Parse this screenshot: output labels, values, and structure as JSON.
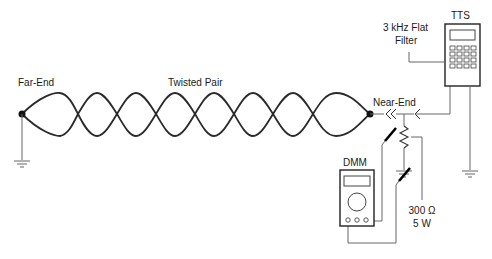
{
  "diagram": {
    "type": "test-setup-schematic",
    "labels": {
      "far_end": "Far-End",
      "twisted_pair": "Twisted Pair",
      "near_end": "Near-End",
      "filter_line1": "3 kHz Flat",
      "filter_line2": "Filter",
      "tts": "TTS",
      "dmm": "DMM",
      "resistor_value": "300 Ω",
      "resistor_power": "5 W"
    },
    "components": [
      {
        "id": "far-end-terminal",
        "kind": "node",
        "grounded": true
      },
      {
        "id": "twisted-pair",
        "kind": "cable",
        "twists": 8
      },
      {
        "id": "near-end-terminal",
        "kind": "node"
      },
      {
        "id": "tts",
        "kind": "test-set",
        "keypad": "4x4"
      },
      {
        "id": "dmm",
        "kind": "multimeter",
        "jacks": 3
      },
      {
        "id": "resistor",
        "kind": "resistor",
        "value": "300 Ω",
        "power": "5 W",
        "grounded": true
      }
    ],
    "colors": {
      "line": "#2a2a2a",
      "leader": "#666666",
      "background": "#ffffff"
    }
  }
}
